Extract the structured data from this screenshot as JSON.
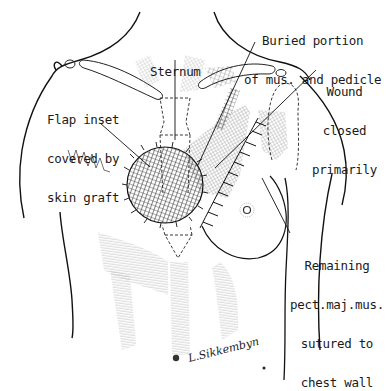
{
  "figure": {
    "type": "surgical-illustration",
    "colors": {
      "ink": "#1a1a1a",
      "background": "#ffffff",
      "hatch": "#555555"
    }
  },
  "labels": {
    "sternum": {
      "lines": [
        "Sternum"
      ]
    },
    "buried": {
      "lines": [
        "Buried portion",
        "of mus. and pedicle"
      ]
    },
    "wound": {
      "lines": [
        "Wound",
        "closed",
        "primarily"
      ]
    },
    "flap": {
      "lines": [
        "Flap inset",
        "covered by",
        "skin graft"
      ]
    },
    "remaining": {
      "lines": [
        "Remaining",
        "pect.maj.mus.",
        "sutured to",
        "chest wall"
      ]
    }
  },
  "signature": {
    "text": "L.Sikkembyn"
  }
}
